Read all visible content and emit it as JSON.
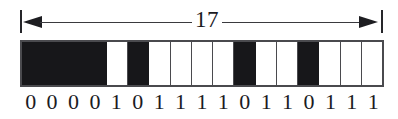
{
  "figure": {
    "name": "binary-string-length-diagram",
    "background_color": "#ffffff",
    "ink_color": "#1b1b1f"
  },
  "dimension": {
    "label": "17",
    "tick_left": "|",
    "tick_right": "|",
    "arrow_left_icon": "arrow-left-icon",
    "arrow_right_icon": "arrow-right-icon",
    "units": "bits",
    "color": "#1d1d21"
  },
  "bit_string": {
    "length": 17,
    "value": "00001011110110111",
    "fill_legend": {
      "0": "black",
      "1": "white"
    },
    "filled_color": "#17171a",
    "empty_color": "#ffffff",
    "border_color": "#4a4a4e",
    "cells": [
      {
        "index": 1,
        "bit": "0",
        "fill": "filled"
      },
      {
        "index": 2,
        "bit": "0",
        "fill": "filled"
      },
      {
        "index": 3,
        "bit": "0",
        "fill": "filled"
      },
      {
        "index": 4,
        "bit": "0",
        "fill": "filled"
      },
      {
        "index": 5,
        "bit": "1",
        "fill": "empty"
      },
      {
        "index": 6,
        "bit": "0",
        "fill": "filled"
      },
      {
        "index": 7,
        "bit": "1",
        "fill": "empty"
      },
      {
        "index": 8,
        "bit": "1",
        "fill": "empty"
      },
      {
        "index": 9,
        "bit": "1",
        "fill": "empty"
      },
      {
        "index": 10,
        "bit": "1",
        "fill": "empty"
      },
      {
        "index": 11,
        "bit": "0",
        "fill": "filled"
      },
      {
        "index": 12,
        "bit": "1",
        "fill": "empty"
      },
      {
        "index": 13,
        "bit": "1",
        "fill": "empty"
      },
      {
        "index": 14,
        "bit": "0",
        "fill": "filled"
      },
      {
        "index": 15,
        "bit": "1",
        "fill": "empty"
      },
      {
        "index": 16,
        "bit": "1",
        "fill": "empty"
      },
      {
        "index": 17,
        "bit": "1",
        "fill": "empty"
      }
    ]
  }
}
